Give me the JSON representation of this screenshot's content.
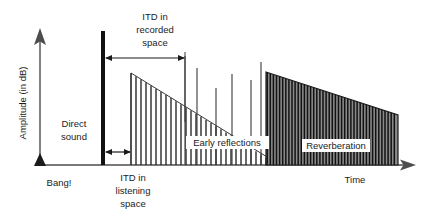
{
  "figure": {
    "title_visible": false,
    "axes": {
      "y_label": "Amplitude (in dB)",
      "x_label": "Time",
      "origin_label": "Bang!",
      "y_axis_name": "amplitude-axis",
      "x_axis_name": "time-axis"
    },
    "annotations": {
      "direct_sound": "Direct\nsound",
      "direct_sound_line1": "Direct",
      "direct_sound_line2": "sound",
      "itd_recorded_line1": "ITD in",
      "itd_recorded_line2": "recorded",
      "itd_recorded_line3": "space",
      "itd_listening_line1": "ITD in",
      "itd_listening_line2": "listening",
      "itd_listening_line3": "space",
      "early_reflections": "Early reflections",
      "reverberation": "Reverberation"
    },
    "colors": {
      "ink": "#1b1b1b",
      "axis": "#4d4d4d",
      "impulse_bar": "#111111",
      "reverb_fill": "#8a8a8a",
      "background": "#ffffff"
    }
  },
  "chart_data": {
    "type": "diagram",
    "xlabel": "Time",
    "ylabel": "Amplitude (in dB)",
    "baseline_y": 165,
    "direct_sound": {
      "x": 103,
      "top_y": 31,
      "bottom_y": 165,
      "thickness": 4
    },
    "early_reflections_envelope": {
      "x_start": 131,
      "x_end": 270,
      "y_start": 73,
      "y_end": 160,
      "comb_spacing": 5,
      "comb_count": 28
    },
    "early_reflections_spikes_x": [
      185,
      197,
      216,
      232,
      251,
      261
    ],
    "early_reflections_spikes_top_y": [
      56,
      68,
      88,
      74,
      80,
      62
    ],
    "reverberation_block": {
      "x_start": 266,
      "x_end": 398,
      "y_start": 72,
      "y_end": 115,
      "stripe_spacing": 3.1,
      "stripe_count": 43
    },
    "itd_recorded_arrow": {
      "x1": 105,
      "x2": 185,
      "y": 58
    },
    "itd_listening_arrow": {
      "x1": 105,
      "x2": 130,
      "y": 152
    },
    "guide_line_recorded": {
      "x": 185,
      "y1": 55,
      "y2": 122
    }
  }
}
